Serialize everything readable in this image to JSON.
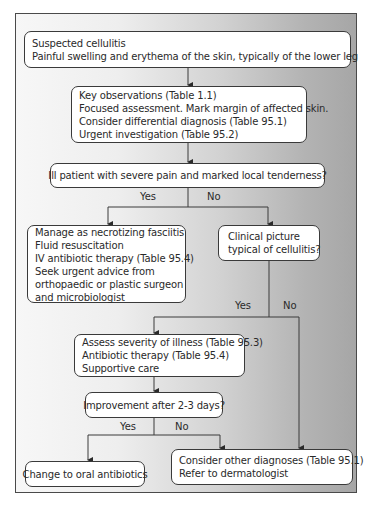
{
  "flowchart": {
    "start": {
      "lines": [
        "Suspected cellulitis",
        "Painful swelling and erythema of the skin, typically of the lower leg"
      ]
    },
    "key_observations": {
      "lines": [
        "Key observations (Table 1.1)",
        "Focused assessment. Mark margin of affected skin.",
        "Consider differential diagnosis (Table 95.1)",
        "Urgent investigation (Table 95.2)"
      ]
    },
    "question_ill": {
      "text": "Ill patient with severe pain and marked local tenderness?",
      "yes": "Yes",
      "no": "No"
    },
    "necrotizing": {
      "lines": [
        "Manage as necrotizing fasciitis",
        "Fluid resuscitation",
        "IV antibiotic therapy (Table 95.4)",
        "Seek urgent advice from",
        "orthopaedic or plastic surgeon",
        "and microbiologist"
      ]
    },
    "question_clinical": {
      "lines": [
        "Clinical picture",
        "typical of cellulitis?"
      ],
      "yes": "Yes",
      "no": "No"
    },
    "assess": {
      "lines": [
        "Assess severity of illness (Table 95.3)",
        "Antibiotic therapy (Table 95.4)",
        "Supportive care"
      ]
    },
    "question_improvement": {
      "text": "Improvement after 2-3 days?",
      "yes": "Yes",
      "no": "No"
    },
    "oral": {
      "text": "Change to oral antibiotics"
    },
    "other": {
      "lines": [
        "Consider other diagnoses (Table 95.1)",
        "Refer to dermatologist"
      ]
    }
  },
  "colors": {
    "border": "#3a3a3a",
    "frame_border": "#4a4a4a",
    "box_fill": "#ffffff",
    "gradient_left": "#f7f7f7",
    "gradient_right": "#a6a6a6"
  }
}
